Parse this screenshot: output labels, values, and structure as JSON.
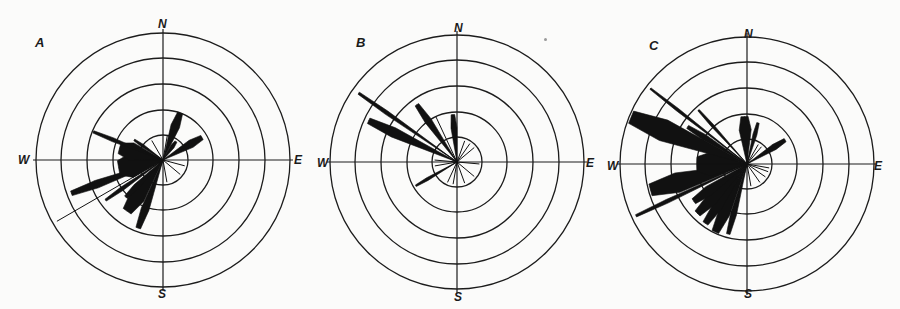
{
  "figure": {
    "panels": [
      "A",
      "B",
      "C"
    ],
    "compass": {
      "N": "N",
      "E": "E",
      "S": "S",
      "W": "W"
    },
    "colors": {
      "ink": "#111111",
      "paper": "#fbfbfa",
      "ring": "#1c1c1c"
    }
  },
  "chart_data": [
    {
      "type": "rose",
      "title": "A",
      "center": [
        163,
        160
      ],
      "ring_radii_px": [
        25,
        50,
        76,
        102,
        127
      ],
      "ring_units": [
        1,
        2,
        3,
        4,
        5
      ],
      "labels": {
        "N": "N",
        "E": "E",
        "S": "S",
        "W": "W"
      },
      "petals": [
        {
          "bearing": 20,
          "length": 2.0,
          "width": 9
        },
        {
          "bearing": 35,
          "length": 0.9,
          "width": 4
        },
        {
          "bearing": 60,
          "length": 1.8,
          "width": 8
        },
        {
          "bearing": 10,
          "length": 1.0,
          "width": 2
        },
        {
          "bearing": 105,
          "length": 0.9,
          "width": 2
        },
        {
          "bearing": 130,
          "length": 0.9,
          "width": 2
        },
        {
          "bearing": 170,
          "length": 0.9,
          "width": 2
        },
        {
          "bearing": 200,
          "length": 2.9,
          "width": 8
        },
        {
          "bearing": 215,
          "length": 2.5,
          "width": 16
        },
        {
          "bearing": 225,
          "length": 2.1,
          "width": 6
        },
        {
          "bearing": 235,
          "length": 2.8,
          "width": 4
        },
        {
          "bearing": 240,
          "length": 4.9,
          "width": 2
        },
        {
          "bearing": 250,
          "length": 3.9,
          "width": 8
        },
        {
          "bearing": 260,
          "length": 1.8,
          "width": 24
        },
        {
          "bearing": 285,
          "length": 1.8,
          "width": 18
        },
        {
          "bearing": 292,
          "length": 3.0,
          "width": 4
        },
        {
          "bearing": 305,
          "length": 1.4,
          "width": 3
        },
        {
          "bearing": 330,
          "length": 0.9,
          "width": 2
        }
      ]
    },
    {
      "type": "rose",
      "title": "B",
      "center": [
        457,
        162
      ],
      "ring_radii_px": [
        25,
        50,
        76,
        102,
        127
      ],
      "ring_units": [
        1,
        2,
        3,
        4,
        5
      ],
      "labels": {
        "N": "N",
        "E": "E",
        "S": "S",
        "W": "W"
      },
      "petals": [
        {
          "bearing": 355,
          "length": 1.9,
          "width": 6
        },
        {
          "bearing": 20,
          "length": 0.9,
          "width": 2
        },
        {
          "bearing": 35,
          "length": 0.9,
          "width": 2
        },
        {
          "bearing": 50,
          "length": 0.9,
          "width": 2
        },
        {
          "bearing": 95,
          "length": 0.9,
          "width": 2
        },
        {
          "bearing": 130,
          "length": 0.9,
          "width": 2
        },
        {
          "bearing": 160,
          "length": 0.9,
          "width": 2
        },
        {
          "bearing": 190,
          "length": 0.9,
          "width": 2
        },
        {
          "bearing": 205,
          "length": 0.9,
          "width": 2
        },
        {
          "bearing": 240,
          "length": 1.9,
          "width": 3
        },
        {
          "bearing": 260,
          "length": 0.9,
          "width": 2
        },
        {
          "bearing": 275,
          "length": 0.9,
          "width": 2
        },
        {
          "bearing": 295,
          "length": 3.9,
          "width": 10
        },
        {
          "bearing": 305,
          "length": 4.8,
          "width": 4
        },
        {
          "bearing": 325,
          "length": 2.8,
          "width": 7
        },
        {
          "bearing": 335,
          "length": 2.0,
          "width": 2
        }
      ]
    },
    {
      "type": "rose",
      "title": "C",
      "center": [
        747,
        164
      ],
      "ring_radii_px": [
        25,
        50,
        76,
        102,
        127
      ],
      "ring_units": [
        1,
        2,
        3,
        4,
        5
      ],
      "labels": {
        "N": "N",
        "E": "E",
        "S": "S",
        "W": "W"
      },
      "petals": [
        {
          "bearing": 357,
          "length": 1.9,
          "width": 12
        },
        {
          "bearing": 15,
          "length": 1.7,
          "width": 4
        },
        {
          "bearing": 30,
          "length": 0.9,
          "width": 2
        },
        {
          "bearing": 40,
          "length": 0.9,
          "width": 2
        },
        {
          "bearing": 58,
          "length": 1.8,
          "width": 6
        },
        {
          "bearing": 100,
          "length": 0.9,
          "width": 2
        },
        {
          "bearing": 110,
          "length": 0.9,
          "width": 2
        },
        {
          "bearing": 125,
          "length": 0.9,
          "width": 2
        },
        {
          "bearing": 145,
          "length": 0.9,
          "width": 2
        },
        {
          "bearing": 170,
          "length": 0.9,
          "width": 2
        },
        {
          "bearing": 195,
          "length": 2.9,
          "width": 6
        },
        {
          "bearing": 205,
          "length": 3.0,
          "width": 12
        },
        {
          "bearing": 215,
          "length": 2.9,
          "width": 10
        },
        {
          "bearing": 225,
          "length": 2.8,
          "width": 12
        },
        {
          "bearing": 235,
          "length": 2.6,
          "width": 10
        },
        {
          "bearing": 245,
          "length": 4.9,
          "width": 4
        },
        {
          "bearing": 255,
          "length": 4.0,
          "width": 20
        },
        {
          "bearing": 270,
          "length": 2.0,
          "width": 24
        },
        {
          "bearing": 292,
          "length": 5.0,
          "width": 22
        },
        {
          "bearing": 302,
          "length": 2.8,
          "width": 6
        },
        {
          "bearing": 308,
          "length": 4.9,
          "width": 3
        },
        {
          "bearing": 318,
          "length": 2.9,
          "width": 3
        }
      ]
    }
  ]
}
